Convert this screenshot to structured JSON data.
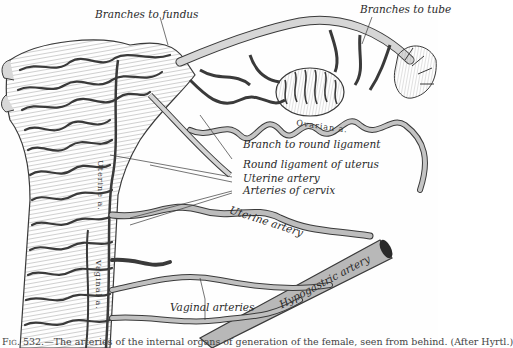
{
  "figure": {
    "subject": "Arteries of the internal organs of generation of the female, seen from behind",
    "style": "engraving",
    "colors": {
      "ink": "#2a2a2a",
      "vessel_fill": "#bdbdbd",
      "vessel_edge": "#3a3a3a",
      "paper": "#fefefe"
    }
  },
  "labels": {
    "branches_to_fundus": "Branches to fundus",
    "branches_to_tube": "Branches to tube",
    "ovarian_a": "Ovarian a.",
    "branch_to_round_ligament": "Branch to round ligament",
    "round_ligament_of_uterus": "Round ligament of uterus",
    "uterine_artery_upper": "Uterine artery",
    "arteries_of_cervix": "Arteries of cervix",
    "uterine_artery_lower": "Uterine artery",
    "vaginal_arteries": "Vaginal arteries",
    "hypogastric_artery": "Hypogastric artery",
    "uterine_a_vertical": "Uterine a.",
    "vaginal_a_vertical": "Vaginal a."
  },
  "caption": {
    "fig": "Fig. 532.",
    "text": "—The arteries of the internal organs of generation of the female, seen from behind. (After Hyrtl.)"
  }
}
